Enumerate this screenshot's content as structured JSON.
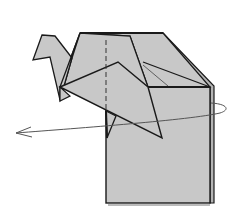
{
  "diagram": {
    "caption": "Turn the model over",
    "colors": {
      "paper": "#c8c8c8",
      "paper_dark": "#b4b4b4",
      "edge": "#1a1a1a",
      "fold_line": "#333333",
      "arrow": "#555555",
      "background": "#ffffff"
    },
    "elements": [
      {
        "id": "crane-head",
        "label": "Crane head and neck"
      },
      {
        "id": "crane-body",
        "label": "Crane body"
      },
      {
        "id": "crane-wing",
        "label": "Crane wing"
      },
      {
        "id": "base-square",
        "label": "Square base paper"
      },
      {
        "id": "valley-fold-line",
        "label": "Dashed fold line"
      },
      {
        "id": "turn-over-arrow",
        "label": "Turn over arrow"
      }
    ]
  }
}
